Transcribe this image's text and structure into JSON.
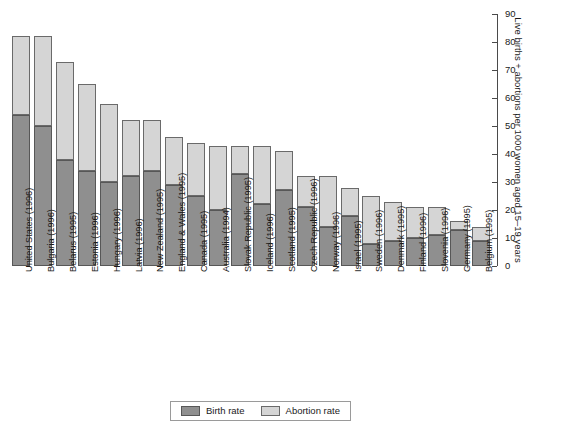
{
  "chart_data": {
    "type": "bar",
    "subtype": "stacked-vertical",
    "title": "",
    "xlabel": "",
    "ylabel": "Live births + abortions per 1000 women aged 15–19 years",
    "ylim": [
      0,
      90
    ],
    "yticks": [
      0,
      10,
      20,
      30,
      40,
      50,
      60,
      70,
      80,
      90
    ],
    "grid": false,
    "legend_position": "bottom-center",
    "categories": [
      "United States (1996)",
      "Bulgaria (1996)",
      "Belarus (1995)",
      "Estonia (1996)",
      "Hungary (1996)",
      "Latvia (1996)",
      "New Zealand (1995)",
      "England & Wales (1995)",
      "Canada (1995)",
      "Australia (1994)",
      "Slovak Republic (1995)",
      "Iceland (1996)",
      "Scotland (1995)",
      "Czech Republic (1996)",
      "Norway (1996)",
      "Israel (1995)",
      "Sweden (1996)",
      "Denmark (1995)",
      "Finland (1996)",
      "Slovenia (1996)",
      "Germany (1995)",
      "Belgium (1995)"
    ],
    "series": [
      {
        "name": "Birth rate",
        "color": "#8f8f8f",
        "values": [
          54,
          50,
          38,
          34,
          30,
          32,
          34,
          29,
          25,
          20,
          33,
          22,
          27,
          21,
          14,
          18,
          8,
          9,
          10,
          11,
          13,
          9
        ]
      },
      {
        "name": "Abortion rate",
        "color": "#d5d5d5",
        "values": [
          28,
          32,
          35,
          31,
          28,
          20,
          18,
          17,
          19,
          23,
          10,
          21,
          14,
          11,
          18,
          10,
          17,
          14,
          11,
          10,
          3,
          5
        ]
      }
    ],
    "totals": [
      82,
      82,
      73,
      65,
      58,
      52,
      52,
      46,
      44,
      43,
      43,
      43,
      41,
      32,
      32,
      28,
      25,
      23,
      21,
      21,
      16,
      14
    ]
  },
  "legend": {
    "items": [
      {
        "label": "Birth rate",
        "swatch": "birth-rate-swatch"
      },
      {
        "label": "Abortion rate",
        "swatch": "abortion-rate-swatch"
      }
    ]
  },
  "axis": {
    "y_title": "Live births + abortions per 1000 women aged 15–19 years"
  }
}
